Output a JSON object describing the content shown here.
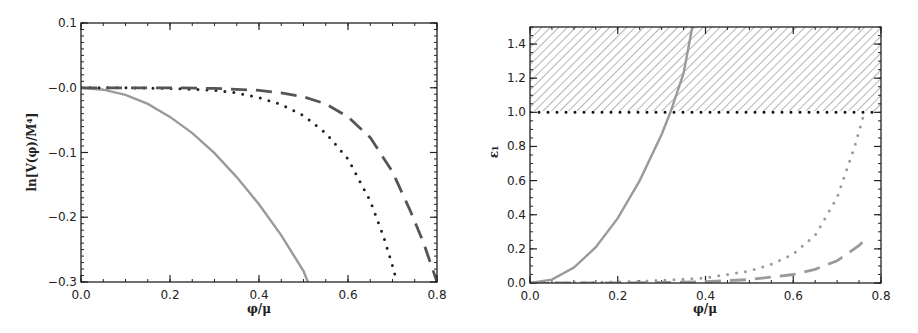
{
  "chart_data": [
    {
      "type": "line",
      "title": "",
      "xlabel": "φ/μ",
      "ylabel": "ln[V(φ)/M⁴]",
      "xlim": [
        0.0,
        0.8
      ],
      "ylim": [
        -0.3,
        0.1
      ],
      "xticks": [
        "0.0",
        "0.2",
        "0.4",
        "0.6",
        "0.8"
      ],
      "yticks": [
        "0.1",
        "-0.0",
        "-0.1",
        "-0.2",
        "-0.3"
      ],
      "grid": false,
      "series": [
        {
          "name": "solid",
          "style": "solid",
          "color": "#9a9a9a",
          "x": [
            0.0,
            0.05,
            0.1,
            0.15,
            0.2,
            0.25,
            0.3,
            0.35,
            0.4,
            0.45,
            0.5,
            0.51
          ],
          "y": [
            0.0,
            -0.003,
            -0.011,
            -0.025,
            -0.045,
            -0.07,
            -0.101,
            -0.138,
            -0.18,
            -0.228,
            -0.283,
            -0.3
          ]
        },
        {
          "name": "dotted",
          "style": "dotted",
          "color": "#222222",
          "x": [
            0.0,
            0.1,
            0.2,
            0.3,
            0.35,
            0.4,
            0.45,
            0.5,
            0.55,
            0.6,
            0.65,
            0.68,
            0.7,
            0.71
          ],
          "y": [
            0.0,
            0.0,
            -0.001,
            -0.004,
            -0.008,
            -0.015,
            -0.026,
            -0.043,
            -0.07,
            -0.11,
            -0.175,
            -0.23,
            -0.275,
            -0.3
          ]
        },
        {
          "name": "dashed",
          "style": "dashed",
          "color": "#555555",
          "x": [
            0.0,
            0.1,
            0.2,
            0.3,
            0.4,
            0.45,
            0.5,
            0.55,
            0.6,
            0.65,
            0.7,
            0.74,
            0.77,
            0.8
          ],
          "y": [
            0.0,
            0.0,
            0.0,
            -0.001,
            -0.004,
            -0.008,
            -0.014,
            -0.025,
            -0.045,
            -0.077,
            -0.13,
            -0.19,
            -0.24,
            -0.3
          ]
        }
      ]
    },
    {
      "type": "line",
      "title": "",
      "xlabel": "φ/μ",
      "ylabel": "ε₁",
      "xlim": [
        0.0,
        0.8
      ],
      "ylim": [
        0.0,
        1.5
      ],
      "xticks": [
        "0.0",
        "0.2",
        "0.4",
        "0.6",
        "0.8"
      ],
      "yticks": [
        "0.0",
        "0.2",
        "0.4",
        "0.6",
        "0.8",
        "1.0",
        "1.2",
        "1.4"
      ],
      "grid": false,
      "annotations": [
        "hatched region ε₁ > 1 (1.0 to 1.5)",
        "dotted horizontal line at ε₁ = 1"
      ],
      "series": [
        {
          "name": "solid",
          "style": "solid",
          "color": "#9a9a9a",
          "x": [
            0.0,
            0.05,
            0.1,
            0.15,
            0.2,
            0.25,
            0.3,
            0.32,
            0.35,
            0.37
          ],
          "y": [
            0.0,
            0.02,
            0.09,
            0.21,
            0.38,
            0.6,
            0.87,
            1.0,
            1.23,
            1.5
          ]
        },
        {
          "name": "dotted",
          "style": "dotted",
          "color": "#9a9a9a",
          "x": [
            0.0,
            0.1,
            0.2,
            0.3,
            0.4,
            0.5,
            0.55,
            0.6,
            0.65,
            0.7,
            0.72,
            0.74,
            0.76
          ],
          "y": [
            0.0,
            0.002,
            0.006,
            0.015,
            0.03,
            0.07,
            0.11,
            0.17,
            0.28,
            0.5,
            0.65,
            0.8,
            0.98
          ]
        },
        {
          "name": "dashed",
          "style": "dashed",
          "color": "#9a9a9a",
          "x": [
            0.0,
            0.2,
            0.3,
            0.4,
            0.5,
            0.6,
            0.65,
            0.7,
            0.75,
            0.77
          ],
          "y": [
            0.0,
            0.0,
            0.003,
            0.008,
            0.02,
            0.05,
            0.08,
            0.13,
            0.22,
            0.27
          ]
        },
        {
          "name": "epsilon=1",
          "style": "dotted",
          "color": "#111111",
          "x": [
            0.0,
            0.8
          ],
          "y": [
            1.0,
            1.0
          ]
        }
      ]
    }
  ]
}
